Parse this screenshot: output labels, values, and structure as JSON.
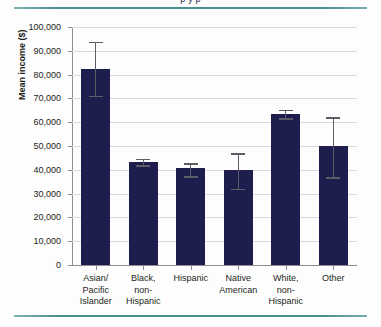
{
  "figure": {
    "clipped_title_fragment": "p  y     p",
    "rule_color": "#4c8d90",
    "bar_color": "#1d1e4e",
    "errorbar_color": "#5d5d66",
    "grid_color": "#d9d9dd"
  },
  "chart_data": {
    "type": "bar",
    "title": "",
    "xlabel": "",
    "ylabel": "Mean income ($)",
    "ylim": [
      0,
      100000
    ],
    "ytick_values": [
      0,
      10000,
      20000,
      30000,
      40000,
      50000,
      60000,
      70000,
      80000,
      90000,
      100000
    ],
    "ytick_labels": [
      "0",
      "10,000",
      "20,000",
      "30,000",
      "40,000",
      "50,000",
      "60,000",
      "70,000",
      "80,000",
      "90,000",
      "100,000"
    ],
    "grid": true,
    "legend": false,
    "categories": [
      "Asian/ Pacific Islander",
      "Black, non- Hispanic",
      "Hispanic",
      "Native American",
      "White, non- Hispanic",
      "Other"
    ],
    "category_lines": [
      [
        "Asian/",
        "Pacific",
        "Islander"
      ],
      [
        "Black,",
        "non-",
        "Hispanic"
      ],
      [
        "Hispanic"
      ],
      [
        "Native",
        "American"
      ],
      [
        "White,",
        "non-",
        "Hispanic"
      ],
      [
        "Other"
      ]
    ],
    "values": [
      82500,
      43200,
      40800,
      39800,
      63500,
      50000
    ],
    "error_low": [
      71200,
      42000,
      37200,
      32000,
      61800,
      37000
    ],
    "error_high": [
      93800,
      44600,
      42800,
      47000,
      65200,
      62000
    ]
  }
}
